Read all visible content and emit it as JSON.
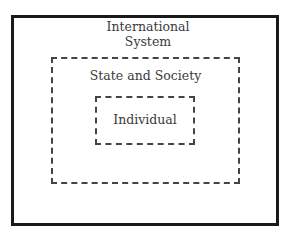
{
  "diagram": {
    "type": "nested-levels-of-analysis",
    "levels": [
      {
        "id": "outer",
        "label_line1": "International",
        "label_line2": "System",
        "border": "solid"
      },
      {
        "id": "middle",
        "label": "State and Society",
        "border": "dashed"
      },
      {
        "id": "inner",
        "label": "Individual",
        "border": "dashed"
      }
    ]
  }
}
